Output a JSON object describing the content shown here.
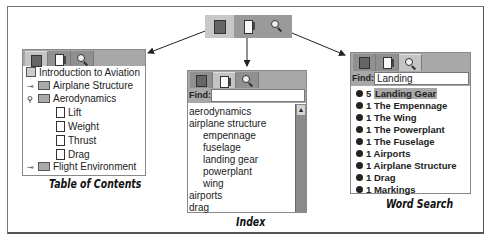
{
  "top_tabs": [
    {
      "icon": "book-icon",
      "label": "Table of Contents"
    },
    {
      "icon": "page-icon",
      "label": "Index"
    },
    {
      "icon": "magnifier-icon",
      "label": "Word Search"
    }
  ],
  "toc": {
    "caption": "Table of Contents",
    "items": [
      {
        "label": "Introduction to Aviation",
        "icon": "book-stack-icon",
        "level": 0
      },
      {
        "label": "Airplane Structure",
        "icon": "folder-icon",
        "level": 1,
        "expander": "collapsed-key-icon"
      },
      {
        "label": "Aerodynamics",
        "icon": "folder-icon",
        "level": 1,
        "expander": "expanded-key-icon"
      },
      {
        "label": "Lift",
        "icon": "document-icon",
        "level": 2
      },
      {
        "label": "Weight",
        "icon": "document-icon",
        "level": 2
      },
      {
        "label": "Thrust",
        "icon": "document-icon",
        "level": 2
      },
      {
        "label": "Drag",
        "icon": "document-icon",
        "level": 2
      },
      {
        "label": "Flight Environment",
        "icon": "folder-icon",
        "level": 1,
        "expander": "collapsed-key-icon"
      }
    ]
  },
  "index": {
    "caption": "Index",
    "find_label": "Find:",
    "find_value": "",
    "items": [
      {
        "label": "aerodynamics",
        "level": 0
      },
      {
        "label": "airplane structure",
        "level": 0
      },
      {
        "label": "empennage",
        "level": 1
      },
      {
        "label": "fuselage",
        "level": 1
      },
      {
        "label": "landing gear",
        "level": 1
      },
      {
        "label": "powerplant",
        "level": 1
      },
      {
        "label": "wing",
        "level": 1
      },
      {
        "label": "airports",
        "level": 0
      },
      {
        "label": "drag",
        "level": 0
      }
    ]
  },
  "word_search": {
    "caption": "Word Search",
    "find_label": "Find:",
    "find_value": "Landing",
    "results": [
      {
        "count": "5",
        "label": "Landing Gear",
        "selected": true
      },
      {
        "count": "1",
        "label": "The Empennage"
      },
      {
        "count": "1",
        "label": "The Wing"
      },
      {
        "count": "1",
        "label": "The Powerplant"
      },
      {
        "count": "1",
        "label": "The Fuselage"
      },
      {
        "count": "1",
        "label": "Airports"
      },
      {
        "count": "1",
        "label": "Airplane Structure"
      },
      {
        "count": "1",
        "label": "Drag"
      },
      {
        "count": "1",
        "label": "Markings"
      }
    ]
  }
}
